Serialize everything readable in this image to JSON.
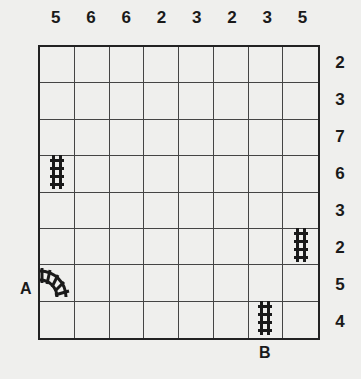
{
  "puzzle": {
    "type": "train-tracks",
    "rows": 8,
    "cols": 8,
    "column_clues": [
      "5",
      "6",
      "6",
      "2",
      "3",
      "2",
      "3",
      "5"
    ],
    "row_clues": [
      "2",
      "3",
      "7",
      "6",
      "3",
      "2",
      "5",
      "4"
    ],
    "given_tracks": [
      {
        "row": 3,
        "col": 0,
        "piece": "vertical"
      },
      {
        "row": 5,
        "col": 7,
        "piece": "vertical"
      },
      {
        "row": 6,
        "col": 0,
        "piece": "curve-west-north"
      },
      {
        "row": 7,
        "col": 6,
        "piece": "vertical"
      }
    ],
    "start": {
      "label": "A",
      "row": 6,
      "side": "left"
    },
    "end": {
      "label": "B",
      "col": 6,
      "side": "bottom"
    }
  },
  "colors": {
    "background": "#efefed",
    "ink": "#1a1a1a",
    "grid": "#444444"
  }
}
